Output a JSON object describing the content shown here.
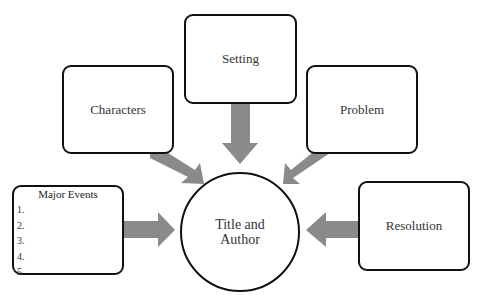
{
  "diagram": {
    "type": "story-map graphic organizer",
    "center": {
      "line1": "Title and",
      "line2": "Author"
    },
    "nodes": {
      "setting": "Setting",
      "characters": "Characters",
      "problem": "Problem",
      "resolution": "Resolution",
      "major_events": {
        "title": "Major Events",
        "items": [
          "1.",
          "2.",
          "3.",
          "4.",
          "5."
        ]
      }
    },
    "colors": {
      "arrow": "#8a8a8a",
      "border": "#111111",
      "background": "#ffffff"
    }
  }
}
